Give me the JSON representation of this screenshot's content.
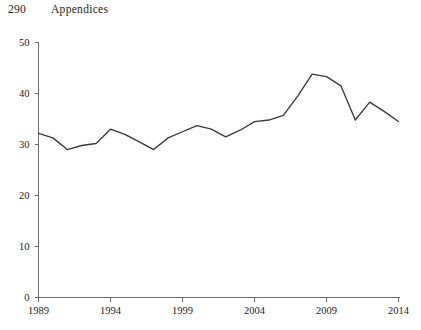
{
  "page": {
    "number": "290",
    "running_head": "Appendices"
  },
  "chart_data": {
    "type": "line",
    "title": "",
    "subtitle": "",
    "xlabel": "",
    "ylabel": "",
    "grid": false,
    "legend": null,
    "line_color": "#3a3a3a",
    "axis_color": "#6b6b6b",
    "background_color": "#ffffff",
    "xlim": [
      1989,
      2014
    ],
    "ylim": [
      0,
      50
    ],
    "x_ticks": [
      1989,
      1994,
      1999,
      2004,
      2009,
      2014
    ],
    "x_tick_labels": [
      "1989",
      "1994",
      "1999",
      "2004",
      "2009",
      "2014"
    ],
    "y_ticks": [
      0,
      10,
      20,
      30,
      40,
      50
    ],
    "y_tick_labels": [
      "0",
      "10",
      "20",
      "30",
      "40",
      "50"
    ],
    "x": [
      1989,
      1990,
      1991,
      1992,
      1993,
      1994,
      1995,
      1996,
      1997,
      1998,
      1999,
      2000,
      2001,
      2002,
      2003,
      2004,
      2005,
      2006,
      2007,
      2008,
      2009,
      2010,
      2011,
      2012,
      2013,
      2014
    ],
    "values": [
      32.2,
      31.3,
      29.0,
      29.8,
      30.2,
      33.0,
      32.0,
      30.5,
      29.0,
      31.3,
      32.5,
      33.7,
      33.0,
      31.5,
      32.8,
      34.5,
      34.8,
      35.7,
      39.5,
      43.8,
      43.3,
      41.5,
      34.8,
      38.3,
      36.5,
      34.5
    ]
  }
}
